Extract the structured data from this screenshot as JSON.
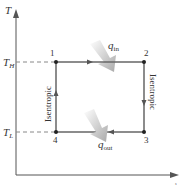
{
  "diagram": {
    "type": "T-s diagram (Carnot cycle)",
    "axes": {
      "y_label": "T",
      "x_label": "s"
    },
    "levels": {
      "high": {
        "label": "T",
        "sub": "H"
      },
      "low": {
        "label": "T",
        "sub": "L"
      }
    },
    "states": [
      "1",
      "2",
      "3",
      "4"
    ],
    "processes": {
      "left": "Isentropic",
      "right": "Isentropic"
    },
    "heat": {
      "in": {
        "label": "q",
        "sub": "in"
      },
      "out": {
        "label": "q",
        "sub": "out"
      }
    },
    "colors": {
      "axis": "#555555",
      "cycle": "#666666",
      "point": "#222222",
      "dash": "#888888",
      "heat_arrow": "#bdbdbd"
    }
  }
}
